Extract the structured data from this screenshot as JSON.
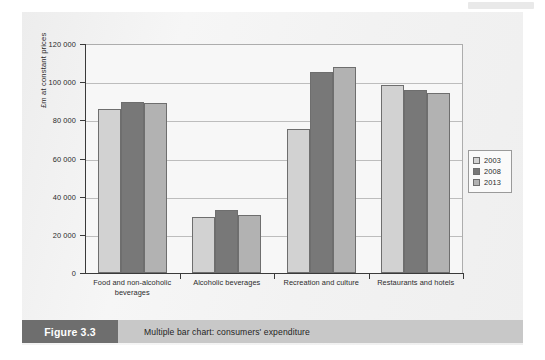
{
  "figure": {
    "number_label": "Figure 3.3",
    "caption": "Multiple bar chart: consumers' expenditure"
  },
  "legend": {
    "position": "right",
    "entries": [
      {
        "label": "2003",
        "color": "#d2d2d2"
      },
      {
        "label": "2008",
        "color": "#787878"
      },
      {
        "label": "2013",
        "color": "#b2b2b2"
      }
    ]
  },
  "chart_data": {
    "type": "bar",
    "title": "Multiple bar chart: consumers' expenditure",
    "xlabel": "",
    "ylabel": "£m at constant prices",
    "ylim": [
      0,
      120000
    ],
    "ytick_labels": [
      "0",
      "20 000",
      "40 000",
      "60 000",
      "80 000",
      "100 000",
      "120 000"
    ],
    "ytick_values": [
      0,
      20000,
      40000,
      60000,
      80000,
      100000,
      120000
    ],
    "grid": true,
    "legend_position": "right",
    "categories": [
      "Food and non-alcoholic beverages",
      "Alcoholic beverages",
      "Recreation and culture",
      "Restaurants and hotels"
    ],
    "series": [
      {
        "name": "2003",
        "color": "#d2d2d2",
        "values": [
          86000,
          29500,
          75500,
          98500
        ]
      },
      {
        "name": "2008",
        "color": "#787878",
        "values": [
          89500,
          33000,
          105500,
          96000
        ]
      },
      {
        "name": "2013",
        "color": "#b2b2b2",
        "values": [
          89000,
          30500,
          108000,
          94500
        ]
      }
    ]
  }
}
